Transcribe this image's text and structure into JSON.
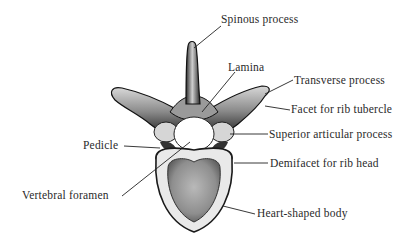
{
  "figure": {
    "labels": {
      "spinous_process": "Spinous process",
      "lamina": "Lamina",
      "transverse_process": "Transverse process",
      "facet_rib_tubercle": "Facet for rib tubercle",
      "pedicle": "Pedicle",
      "superior_articular_process": "Superior articular process",
      "demifacet_rib_head": "Demifacet for rib head",
      "vertebral_foramen": "Vertebral foramen",
      "heart_shaped_body": "Heart-shaped body"
    }
  }
}
